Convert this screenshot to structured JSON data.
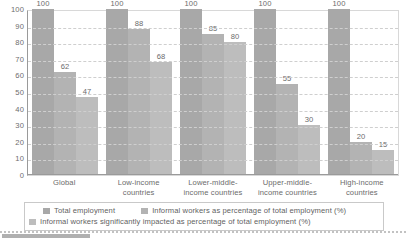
{
  "chart_data": {
    "type": "bar",
    "title": "",
    "xlabel": "",
    "ylabel": "",
    "ylim": [
      0,
      100
    ],
    "yticks": [
      100,
      90,
      80,
      70,
      60,
      50,
      40,
      30,
      20,
      10,
      0
    ],
    "grid": true,
    "legend_position": "bottom",
    "categories": [
      "Global",
      "Low-income countries",
      "Lower-middle-income countries",
      "Upper-middle-income countries",
      "High-income countries"
    ],
    "series": [
      {
        "name": "Total employment",
        "color": "#a8a8a8",
        "values": [
          100,
          100,
          100,
          100,
          100
        ]
      },
      {
        "name": "Informal workers as percentage of total employment  (%)",
        "color": "#b3b3b3",
        "values": [
          62,
          88,
          85,
          55,
          20
        ]
      },
      {
        "name": "Informal workers significantly impacted as percentage of total employment  (%)",
        "color": "#bdbdbd",
        "values": [
          47,
          68,
          80,
          30,
          15
        ]
      }
    ]
  },
  "legend": {
    "items": [
      "Total employment",
      "Informal workers as percentage of total employment  (%)",
      "Informal workers significantly impacted as percentage of total employment  (%)"
    ]
  }
}
